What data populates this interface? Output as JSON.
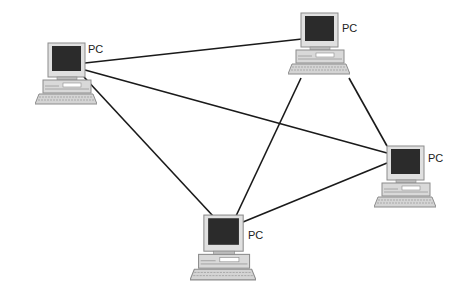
{
  "diagram": {
    "type": "mesh-network",
    "nodes": [
      {
        "id": "pc1",
        "label": "PC",
        "x": 35,
        "y": 42
      },
      {
        "id": "pc2",
        "label": "PC",
        "x": 288,
        "y": 12
      },
      {
        "id": "pc3",
        "label": "PC",
        "x": 374,
        "y": 145
      },
      {
        "id": "pc4",
        "label": "PC",
        "x": 190,
        "y": 212
      }
    ],
    "edges": [
      {
        "from": "pc1",
        "to": "pc2"
      },
      {
        "from": "pc1",
        "to": "pc3"
      },
      {
        "from": "pc1",
        "to": "pc4"
      },
      {
        "from": "pc2",
        "to": "pc3"
      },
      {
        "from": "pc2",
        "to": "pc4"
      },
      {
        "from": "pc3",
        "to": "pc4"
      }
    ]
  },
  "colors": {
    "line": "#1a1a1a",
    "screen": "#2b2b2b",
    "casing": "#d9d9d9",
    "casing_dark": "#9a9a9a"
  }
}
